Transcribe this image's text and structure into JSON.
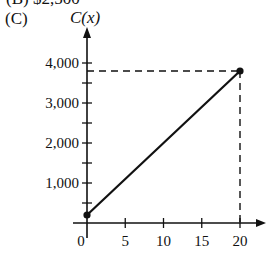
{
  "question": {
    "previous_option_partial": "(B)  $2,500",
    "option_label": "(C)"
  },
  "chart_data": {
    "type": "line",
    "title": "",
    "xlabel": "x",
    "ylabel": "C(x)",
    "x": [
      0,
      20
    ],
    "series": [
      {
        "name": "C(x)",
        "values": [
          200,
          3800
        ],
        "endpoints": "closed-dots"
      }
    ],
    "xticks": [
      0,
      5,
      10,
      15,
      20
    ],
    "xtick_labels": [
      "0",
      "5",
      "10",
      "15",
      "20"
    ],
    "yticks": [
      500,
      1000,
      1500,
      2000,
      2500,
      3000,
      3500,
      4000
    ],
    "ytick_labels": [
      "1,000",
      "2,000",
      "3,000",
      "4,000"
    ],
    "ylabeled_values": [
      1000,
      2000,
      3000,
      4000
    ],
    "xlim": [
      0,
      21
    ],
    "ylim": [
      0,
      4300
    ],
    "grid": false,
    "legend": null,
    "annotations": [
      {
        "type": "dashed-guide",
        "from": [
          0,
          3800
        ],
        "to": [
          20,
          3800
        ]
      },
      {
        "type": "dashed-guide",
        "from": [
          20,
          3800
        ],
        "to": [
          20,
          0
        ]
      }
    ]
  }
}
